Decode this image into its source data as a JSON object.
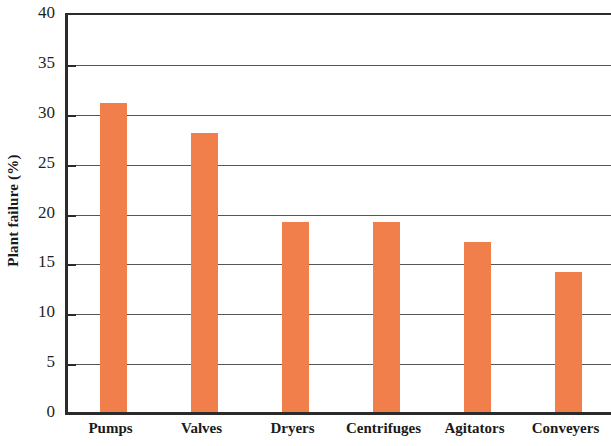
{
  "chart_data": {
    "type": "bar",
    "title": "",
    "xlabel": "",
    "ylabel": "Plant failure (%)",
    "categories": [
      "Pumps",
      "Valves",
      "Dryers",
      "Centrifuges",
      "Agitators",
      "Conveyers"
    ],
    "values": [
      31,
      28,
      19,
      19,
      17,
      14
    ],
    "series": [
      {
        "name": "Plant failure (%)",
        "values": [
          31,
          28,
          19,
          19,
          17,
          14
        ]
      }
    ],
    "ylim": [
      0,
      40
    ],
    "ytick_labels": [
      "0",
      "5",
      "10",
      "15",
      "20",
      "25",
      "30",
      "35",
      "40"
    ],
    "ytick_values": [
      0,
      5,
      10,
      15,
      20,
      25,
      30,
      35,
      40
    ],
    "grid": true,
    "legend": false,
    "legend_position": "none",
    "bar_color": "#f07f4b",
    "axis_color": "#2b2b2b",
    "gridline_color": "#555555"
  }
}
